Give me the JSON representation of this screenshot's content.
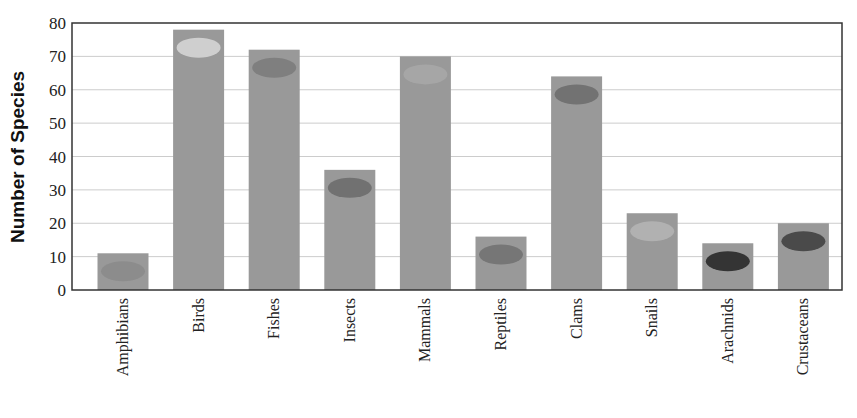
{
  "chart_data": {
    "type": "bar",
    "title": "",
    "xlabel": "",
    "ylabel": "Number of Species",
    "ylim": [
      0,
      80
    ],
    "yticks": [
      0,
      10,
      20,
      30,
      40,
      50,
      60,
      70,
      80
    ],
    "grid": true,
    "legend": null,
    "categories": [
      "Amphibians",
      "Birds",
      "Fishes",
      "Insects",
      "Mammals",
      "Reptiles",
      "Clams",
      "Snails",
      "Arachnids",
      "Crustaceans"
    ],
    "values": [
      11,
      78,
      72,
      36,
      70,
      16,
      64,
      23,
      14,
      20
    ],
    "annotations": [
      "frog",
      "pigeon",
      "fish",
      "ladybug",
      "horse",
      "lizard",
      "clam",
      "snail",
      "spider",
      "lobster"
    ],
    "colors": {
      "bar": "#999999",
      "grid": "#cccccc",
      "axis": "#333333"
    }
  }
}
